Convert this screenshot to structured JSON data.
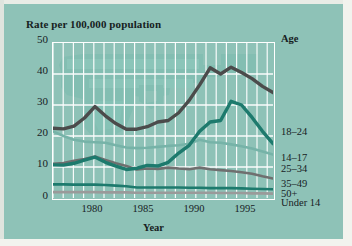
{
  "chart_title": "Rate per 100,000 population",
  "axis": {
    "x_title": "Year",
    "y_ticks": [
      "50",
      "40",
      "30",
      "20",
      "10",
      "0"
    ],
    "x_ticks": [
      "1980",
      "1985",
      "1990",
      "1995"
    ]
  },
  "legend": {
    "header": "Age",
    "items": [
      {
        "label": "18–24",
        "color": "#4b4b4b"
      },
      {
        "label": "14–17",
        "color": "#1d7a6d"
      },
      {
        "label": "25–34",
        "color": "#76b3a8"
      },
      {
        "label": "35–49",
        "color": "#6f6f6f"
      },
      {
        "label": "50+",
        "color": "#1d7a6d"
      },
      {
        "label": "Under 14",
        "color": "#9a9a9a"
      }
    ]
  },
  "colors": {
    "background": "#8ec2b7",
    "gridline": "#ffffff",
    "plot_border": "#ffffff",
    "text": "#17211f",
    "watermark": "#79b8ac"
  },
  "chart_data": {
    "type": "line",
    "title": "Rate per 100,000 population",
    "xlabel": "Year",
    "ylabel": "Rate per 100,000 population",
    "xlim": [
      1976,
      1997
    ],
    "ylim": [
      0,
      50
    ],
    "grid": true,
    "legend_position": "right",
    "x": [
      1976,
      1977,
      1978,
      1979,
      1980,
      1981,
      1982,
      1983,
      1984,
      1985,
      1986,
      1987,
      1988,
      1989,
      1990,
      1991,
      1992,
      1993,
      1994,
      1995,
      1996,
      1997
    ],
    "series": [
      {
        "name": "18–24",
        "color": "#4b4b4b",
        "values": [
          22.5,
          22.3,
          23.2,
          25.8,
          29.5,
          26.5,
          24.0,
          22.2,
          22.2,
          23.0,
          24.5,
          25.0,
          27.5,
          31.5,
          36.5,
          42.0,
          40.0,
          42.2,
          40.5,
          38.5,
          36.0,
          34.0
        ]
      },
      {
        "name": "14–17",
        "color": "#1d7a6d",
        "values": [
          10.7,
          10.6,
          11.2,
          12.2,
          13.2,
          11.5,
          10.3,
          9.2,
          9.6,
          10.5,
          10.3,
          11.5,
          14.5,
          17.0,
          21.5,
          24.5,
          25.0,
          31.2,
          30.0,
          26.0,
          21.5,
          17.5
        ]
      },
      {
        "name": "25–34",
        "color": "#76b3a8",
        "values": [
          21.5,
          20.0,
          18.8,
          18.2,
          18.0,
          17.8,
          17.0,
          16.3,
          16.1,
          16.2,
          16.5,
          16.8,
          17.0,
          17.5,
          18.8,
          18.0,
          17.8,
          17.3,
          16.7,
          16.0,
          15.0,
          14.0
        ]
      },
      {
        "name": "35–49",
        "color": "#6f6f6f",
        "values": [
          11.0,
          11.3,
          12.0,
          12.6,
          13.4,
          12.3,
          11.2,
          10.3,
          9.2,
          9.5,
          9.4,
          9.8,
          9.5,
          9.3,
          9.8,
          9.3,
          9.0,
          8.7,
          8.3,
          7.8,
          7.0,
          6.3
        ]
      },
      {
        "name": "50+",
        "color": "#1d7a6d",
        "values": [
          4.4,
          4.4,
          4.3,
          4.3,
          4.3,
          4.2,
          4.0,
          3.8,
          3.4,
          3.4,
          3.4,
          3.4,
          3.4,
          3.3,
          3.3,
          3.2,
          3.2,
          3.2,
          3.1,
          3.0,
          2.9,
          2.8
        ]
      },
      {
        "name": "Under 14",
        "color": "#9a9a9a",
        "values": [
          1.9,
          1.9,
          1.9,
          1.9,
          1.9,
          1.8,
          1.8,
          1.8,
          1.7,
          1.7,
          1.7,
          1.7,
          1.7,
          1.7,
          1.7,
          1.7,
          1.6,
          1.6,
          1.6,
          1.5,
          1.5,
          1.4
        ]
      }
    ]
  }
}
